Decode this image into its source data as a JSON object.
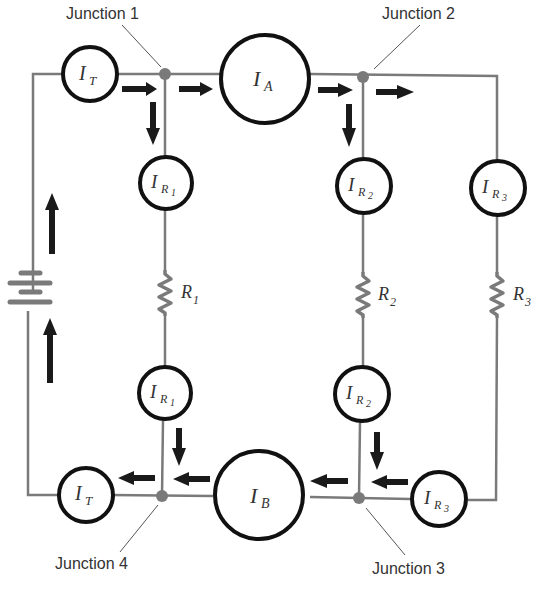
{
  "diagram": {
    "type": "parallel-circuit-current-diagram",
    "junctions": [
      {
        "id": "j1",
        "label": "Junction 1"
      },
      {
        "id": "j2",
        "label": "Junction 2"
      },
      {
        "id": "j3",
        "label": "Junction 3"
      },
      {
        "id": "j4",
        "label": "Junction 4"
      }
    ],
    "meters": {
      "it_top": {
        "main": "I",
        "sub": "T"
      },
      "ia": {
        "main": "I",
        "sub": "A"
      },
      "ir1_top": {
        "main": "I",
        "sub": "R",
        "subsub": "1"
      },
      "ir2_top": {
        "main": "I",
        "sub": "R",
        "subsub": "2"
      },
      "ir3_top": {
        "main": "I",
        "sub": "R",
        "subsub": "3"
      },
      "ir1_bot": {
        "main": "I",
        "sub": "R",
        "subsub": "1"
      },
      "ir2_bot": {
        "main": "I",
        "sub": "R",
        "subsub": "2"
      },
      "ir3_bot": {
        "main": "I",
        "sub": "R",
        "subsub": "3"
      },
      "ib": {
        "main": "I",
        "sub": "B"
      },
      "it_bot": {
        "main": "I",
        "sub": "T"
      }
    },
    "resistors": [
      {
        "id": "r1",
        "main": "R",
        "sub": "1"
      },
      {
        "id": "r2",
        "main": "R",
        "sub": "2"
      },
      {
        "id": "r3",
        "main": "R",
        "sub": "3"
      }
    ],
    "source": "battery",
    "colors": {
      "wire": "#7a7a7a",
      "meter": "#111111",
      "arrow": "#1a1a1a",
      "text": "#333333"
    }
  }
}
